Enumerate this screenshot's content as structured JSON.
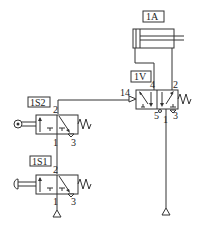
{
  "diagram": {
    "type": "pneumatic circuit",
    "components": {
      "cylinder": {
        "label": "1A"
      },
      "main_valve": {
        "label": "1V",
        "pilot_port": "14",
        "ports": {
          "p4": "4",
          "p2": "2",
          "p5": "5",
          "p1": "1",
          "p3": "3"
        }
      },
      "roller_valve": {
        "label": "1S2",
        "ports": {
          "p2": "2",
          "p1": "1",
          "p3": "3"
        }
      },
      "push_valve": {
        "label": "1S1",
        "ports": {
          "p2": "2",
          "p1": "1",
          "p3": "3"
        }
      }
    }
  }
}
